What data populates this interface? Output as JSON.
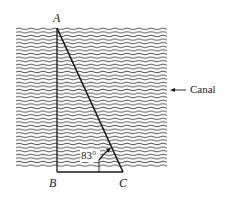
{
  "diagram": {
    "points": {
      "A": {
        "label": "A",
        "x": 57,
        "y": 28
      },
      "B": {
        "label": "B",
        "x": 57,
        "y": 172
      },
      "C": {
        "label": "C",
        "x": 123,
        "y": 172
      }
    },
    "angle_label": "83°",
    "region_label": "Canal",
    "region_arrow": "arrow-left",
    "colors": {
      "line": "#1a1a1a",
      "wave": "#3a3a3a",
      "background": "#ffffff"
    }
  }
}
